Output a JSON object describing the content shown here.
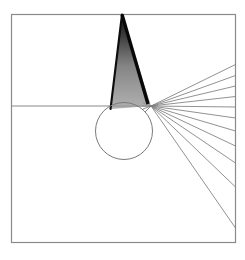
{
  "figure": {
    "background_color": "#ffffff",
    "canvas": {
      "width": 245,
      "height": 260
    }
  },
  "frame": {
    "name": "outer-square-frame",
    "x": 11.5,
    "y": 14.5,
    "width": 224,
    "height": 228,
    "stroke": "#8a8a8a",
    "stroke_width": 1.2,
    "fill": "none"
  },
  "axis": {
    "name": "horizontal-optical-axis",
    "x1": 11.5,
    "y1": 106,
    "x2": 151,
    "y2": 106,
    "stroke": "#8a8a8a",
    "stroke_width": 1
  },
  "circle": {
    "name": "lens-circle",
    "cx": 124,
    "cy": 131,
    "r": 28.5,
    "stroke": "#7a7a7a",
    "stroke_width": 1,
    "fill": "none"
  },
  "convergence_point": {
    "x": 151,
    "y": 106
  },
  "wedge": {
    "name": "incident-ray-wedge",
    "apex": {
      "x": 122,
      "y": 14.5
    },
    "left_foot": {
      "x": 110.5,
      "y": 109
    },
    "right_foot": {
      "x": 151,
      "y": 106
    },
    "left_edge_color": "#0d0d0d",
    "left_edge_width": 2.1,
    "fill_gradient": [
      {
        "offset": 0,
        "color": "#151515",
        "opacity": 1
      },
      {
        "offset": 0.22,
        "color": "#2e2e2e",
        "opacity": 0.94
      },
      {
        "offset": 0.55,
        "color": "#6a6a6a",
        "opacity": 0.82
      },
      {
        "offset": 1,
        "color": "#9b9b9b",
        "opacity": 0.78
      }
    ],
    "core_stripe": {
      "top": {
        "x": 122,
        "y": 14.5
      },
      "bottom": {
        "x": 148,
        "y": 104
      },
      "color": "#080808",
      "width": 3.4
    }
  },
  "exit_rays": {
    "name": "refracted-ray-fan",
    "origin": {
      "x": 151,
      "y": 106
    },
    "stroke": "#7e7e7e",
    "stroke_width": 0.85,
    "count": 11,
    "endpoints": [
      {
        "x": 235.5,
        "y": 64.5
      },
      {
        "x": 235.5,
        "y": 75.5
      },
      {
        "x": 235.5,
        "y": 86.0
      },
      {
        "x": 235.5,
        "y": 96.5
      },
      {
        "x": 235.5,
        "y": 107.0
      },
      {
        "x": 235.5,
        "y": 118.0
      },
      {
        "x": 235.5,
        "y": 131.0
      },
      {
        "x": 235.5,
        "y": 146.0
      },
      {
        "x": 235.5,
        "y": 163.0
      },
      {
        "x": 235.5,
        "y": 187.0
      },
      {
        "x": 235.5,
        "y": 228.0
      }
    ]
  },
  "inner_fan_stubs": {
    "name": "near-origin-ray-stubs",
    "stroke": "#6e6e6e",
    "stroke_width": 0.8,
    "segments": [
      {
        "x1": 145,
        "y1": 100,
        "x2": 151,
        "y2": 106
      },
      {
        "x1": 143,
        "y1": 103,
        "x2": 151,
        "y2": 106
      },
      {
        "x1": 142,
        "y1": 106,
        "x2": 151,
        "y2": 106
      },
      {
        "x1": 143,
        "y1": 109,
        "x2": 151,
        "y2": 106
      },
      {
        "x1": 145,
        "y1": 112,
        "x2": 151,
        "y2": 106
      }
    ]
  }
}
